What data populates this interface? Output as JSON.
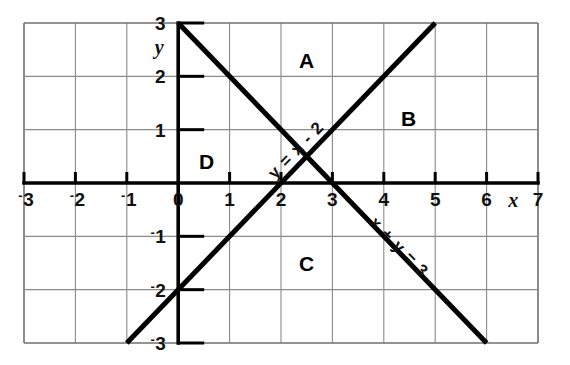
{
  "figure": {
    "background_color": "#ffffff",
    "ink_color": "#000000",
    "grid_color": "#8a8a8a"
  },
  "chart_data": {
    "type": "line",
    "title": "",
    "xlabel": "x",
    "ylabel": "y",
    "xlim": [
      -3,
      7
    ],
    "ylim": [
      -3,
      3
    ],
    "grid": true,
    "grid_step": 1,
    "legend": "none",
    "x_ticks": [
      -3,
      -2,
      -1,
      0,
      1,
      2,
      3,
      4,
      5,
      6,
      7
    ],
    "x_tick_labels": [
      "-3",
      "-2",
      "-1",
      "0",
      "1",
      "2",
      "3",
      "4",
      "5",
      "6",
      "7"
    ],
    "y_ticks": [
      -3,
      -2,
      -1,
      1,
      2,
      3
    ],
    "y_tick_labels": [
      "-3",
      "-2",
      "-1",
      "1",
      "2",
      "3"
    ],
    "negative_sign_style": "raised-superscript-hyphen",
    "series": [
      {
        "name": "y = x - 2",
        "label": "y = x - 2",
        "equation": "y = x - 2",
        "slope": 1,
        "intercept": -2,
        "x": [
          -1,
          5
        ],
        "values": [
          -3,
          3
        ],
        "label_at": {
          "x": 2.3,
          "y": 0.62
        },
        "label_rotation_deg": -46
      },
      {
        "name": "x + y = 3",
        "label": "x + y = 3",
        "equation": "x + y = 3",
        "slope": -1,
        "intercept": 3,
        "x": [
          0,
          6
        ],
        "values": [
          3,
          -3
        ],
        "label_at": {
          "x": 4.3,
          "y": -1.2
        },
        "label_rotation_deg": 46
      }
    ],
    "intersection": {
      "x": 2.5,
      "y": 0.5
    },
    "annotations": [
      {
        "text": "A",
        "x": 2.5,
        "y": 2.3,
        "name": "region-label-a"
      },
      {
        "text": "B",
        "x": 4.48,
        "y": 1.22,
        "name": "region-label-b"
      },
      {
        "text": "C",
        "x": 2.5,
        "y": -1.5,
        "name": "region-label-c"
      },
      {
        "text": "D",
        "x": 0.55,
        "y": 0.42,
        "name": "region-label-d"
      }
    ]
  },
  "axis_names": {
    "x": "x",
    "y": "y"
  },
  "x_labels": [
    {
      "text": "3",
      "neg": true,
      "unit": -3
    },
    {
      "text": "2",
      "neg": true,
      "unit": -2
    },
    {
      "text": "1",
      "neg": true,
      "unit": -1
    },
    {
      "text": "0",
      "neg": false,
      "unit": 0
    },
    {
      "text": "1",
      "neg": false,
      "unit": 1
    },
    {
      "text": "2",
      "neg": false,
      "unit": 2
    },
    {
      "text": "3",
      "neg": false,
      "unit": 3
    },
    {
      "text": "4",
      "neg": false,
      "unit": 4
    },
    {
      "text": "5",
      "neg": false,
      "unit": 5
    },
    {
      "text": "6",
      "neg": false,
      "unit": 6
    },
    {
      "text": "7",
      "neg": false,
      "unit": 7
    }
  ],
  "y_labels": [
    {
      "text": "3",
      "neg": false,
      "unit": 3
    },
    {
      "text": "2",
      "neg": false,
      "unit": 2
    },
    {
      "text": "1",
      "neg": false,
      "unit": 1
    },
    {
      "text": "1",
      "neg": true,
      "unit": -1
    },
    {
      "text": "2",
      "neg": true,
      "unit": -2
    },
    {
      "text": "3",
      "neg": true,
      "unit": -3
    }
  ],
  "line_labels": {
    "line1": "y = x - 2",
    "line2": "x + y = 3"
  },
  "region_labels": {
    "a": "A",
    "b": "B",
    "c": "C",
    "d": "D"
  }
}
